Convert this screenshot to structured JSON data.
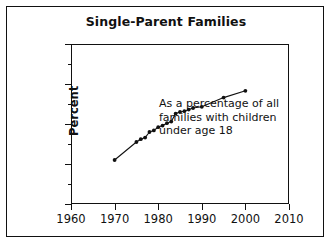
{
  "figure": {
    "title": "Single-Parent Families",
    "annotation_lines": [
      "As a percentage of all",
      "families with children",
      "under age 18"
    ],
    "ylabel": "Percent",
    "line_color": "#111111",
    "marker_color": "#111111",
    "background": "#ffffff"
  },
  "axes": {
    "x_ticks": [
      "1960",
      "1970",
      "1980",
      "1990",
      "2000",
      "2010"
    ],
    "y_ticks": [
      "0",
      "10",
      "20",
      "30",
      "40"
    ],
    "y_minor_ticks": [
      5,
      15,
      25,
      35
    ]
  },
  "chart_data": {
    "type": "line",
    "title": "Single-Parent Families",
    "subtitle": "As a percentage of all families with children under age 18",
    "xlabel": "",
    "ylabel": "Percent",
    "xlim": [
      1960,
      2010
    ],
    "ylim": [
      0,
      40
    ],
    "xticks": [
      1960,
      1970,
      1980,
      1990,
      2000,
      2010
    ],
    "yticks": [
      0,
      10,
      20,
      30,
      40
    ],
    "grid": false,
    "legend": null,
    "marker": "filled-circle",
    "series": [
      {
        "name": "Single-parent families",
        "x": [
          1970,
          1975,
          1976,
          1977,
          1978,
          1979,
          1980,
          1981,
          1982,
          1983,
          1984,
          1985,
          1986,
          1987,
          1988,
          1990,
          1995,
          2000
        ],
        "values": [
          11.0,
          15.5,
          16.2,
          16.6,
          18.0,
          18.4,
          19.2,
          19.6,
          20.2,
          20.6,
          22.6,
          23.0,
          23.2,
          23.6,
          24.0,
          24.3,
          26.6,
          28.3
        ]
      }
    ]
  }
}
